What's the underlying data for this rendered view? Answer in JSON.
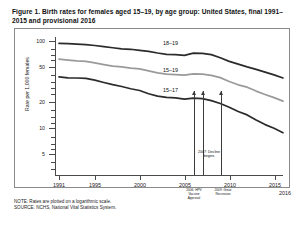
{
  "figure": {
    "title": "Figure 1. Birth rates for females aged 15–19, by age group: United States, final 1991–2015 and provisional 2016",
    "note": "NOTE: Rates are plotted on a logarithmic scale.",
    "source": "SOURCE: NCHS, National Vital Statistics System."
  },
  "chart_data": {
    "type": "line",
    "title": "Birth rates for females aged 15–19, by age group: United States, final 1991–2015 and provisional 2016",
    "xlabel": "",
    "ylabel": "Rate per 1,000 females",
    "yscale": "log",
    "ylim": [
      4,
      120
    ],
    "xlim": [
      1991,
      2016
    ],
    "grid": false,
    "legend_position": "inline-right",
    "ytick_labels": [
      "100",
      "50",
      "20",
      "10",
      "5"
    ],
    "ytick_values": [
      100,
      50,
      20,
      10,
      5
    ],
    "xtick_labels": [
      "1991",
      "1995",
      "2000",
      "2005",
      "2010",
      "2015",
      "2016"
    ],
    "xtick_values": [
      1991,
      1995,
      2000,
      2005,
      2010,
      2015,
      2016
    ],
    "x": [
      1991,
      1992,
      1993,
      1994,
      1995,
      1996,
      1997,
      1998,
      1999,
      2000,
      2001,
      2002,
      2003,
      2004,
      2005,
      2006,
      2007,
      2008,
      2009,
      2010,
      2011,
      2012,
      2013,
      2014,
      2015,
      2016
    ],
    "series": [
      {
        "name": "18–19",
        "label": "18–19",
        "color": "#2b2b2b",
        "values": [
          94.0,
          93.4,
          91.9,
          90.7,
          88.8,
          86.0,
          83.6,
          81.3,
          80.3,
          78.1,
          76.1,
          72.8,
          70.1,
          69.7,
          68.4,
          72.5,
          72.2,
          69.7,
          64.2,
          58.3,
          54.1,
          50.3,
          47.1,
          43.8,
          40.7,
          37.5
        ]
      },
      {
        "name": "15–19",
        "label": "15–19",
        "color": "#9a9a9a",
        "values": [
          61.8,
          60.3,
          59.0,
          58.2,
          56.0,
          53.5,
          51.3,
          50.3,
          48.8,
          47.7,
          45.3,
          43.0,
          41.6,
          41.1,
          40.5,
          41.9,
          41.5,
          40.2,
          37.9,
          34.2,
          31.3,
          29.4,
          26.5,
          24.2,
          22.3,
          20.3
        ]
      },
      {
        "name": "15–17",
        "label": "15–17",
        "color": "#2b2b2b",
        "values": [
          38.6,
          37.6,
          37.5,
          37.2,
          35.5,
          33.3,
          31.4,
          29.9,
          28.2,
          26.9,
          24.7,
          23.2,
          22.4,
          22.1,
          21.4,
          22.0,
          21.7,
          20.6,
          19.1,
          17.3,
          15.4,
          14.1,
          12.3,
          10.9,
          9.9,
          8.8
        ]
      }
    ],
    "annotations": [
      {
        "id": "hpv-vaccine-approval",
        "x": 2006,
        "line1": "2006: HPV",
        "line2": "Vaccine",
        "line3": "Approval"
      },
      {
        "id": "decline-begins",
        "x": 2007,
        "text_line1": "2007: Decline",
        "text_line2": "begins"
      },
      {
        "id": "great-recession",
        "x": 2009,
        "line1": "2009: Great",
        "line2": "Recession"
      }
    ]
  }
}
